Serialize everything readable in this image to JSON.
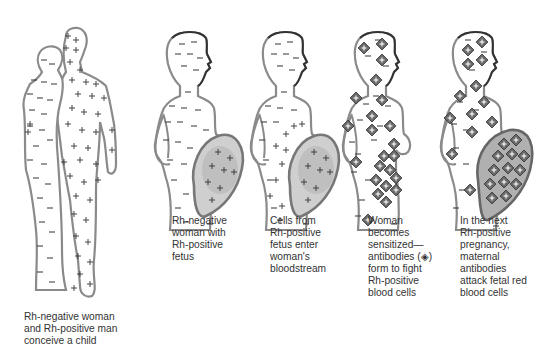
{
  "diagram": {
    "legend": {
      "minus_sign": "Rh-negative blood cells",
      "plus_sign": "Rh-positive blood cells",
      "antibody_glyph": "antibody (diamond with plus)"
    },
    "colors": {
      "outline": "#8a8a8a",
      "outline_dark": "#444444",
      "fill": "#ffffff",
      "uterus": "#9a9a9a",
      "fetus": "#c8c8c8",
      "antibody": "#555555",
      "text": "#333333"
    },
    "panels": [
      {
        "id": "conception",
        "caption": "Rh-negative woman\nand Rh-positive man\nconceive a child"
      },
      {
        "id": "pregnancy",
        "caption": "Rh-negative\nwoman with\nRh-positive\nfetus"
      },
      {
        "id": "cell-transfer",
        "caption": "Cells from\nRh-positive\nfetus enter\nwoman's\nbloodstream"
      },
      {
        "id": "sensitization",
        "caption": "Woman\nbecomes\nsensitized—\nantibodies (◈)\nform to fight\nRh-positive\nblood cells"
      },
      {
        "id": "next-pregnancy",
        "caption": "In the next\nRh-positive\npregnancy,\nmaternal\nantibodies\nattack fetal red\nblood cells"
      }
    ]
  }
}
